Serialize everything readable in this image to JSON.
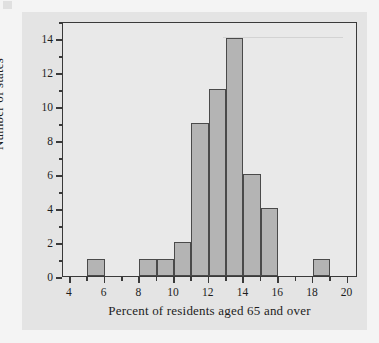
{
  "chart_data": {
    "type": "bar",
    "title": "",
    "subtitle": "",
    "xlabel": "Percent of residents aged 65 and over",
    "ylabel": "Number of states",
    "xlim": [
      3.6,
      20.6
    ],
    "ylim": [
      0,
      15
    ],
    "grid": false,
    "legend": null,
    "bin_width": 1,
    "categories": [
      "5-6",
      "8-9",
      "9-10",
      "10-11",
      "11-12",
      "12-13",
      "13-14",
      "14-15",
      "15-16",
      "18-19"
    ],
    "bins": [
      {
        "start": 5,
        "end": 6,
        "value": 1
      },
      {
        "start": 8,
        "end": 9,
        "value": 1
      },
      {
        "start": 9,
        "end": 10,
        "value": 1
      },
      {
        "start": 10,
        "end": 11,
        "value": 2
      },
      {
        "start": 11,
        "end": 12,
        "value": 9
      },
      {
        "start": 12,
        "end": 13,
        "value": 11
      },
      {
        "start": 13,
        "end": 14,
        "value": 14
      },
      {
        "start": 14,
        "end": 15,
        "value": 6
      },
      {
        "start": 15,
        "end": 16,
        "value": 4
      },
      {
        "start": 18,
        "end": 19,
        "value": 1
      }
    ],
    "values": [
      1,
      1,
      1,
      2,
      9,
      11,
      14,
      6,
      4,
      1
    ],
    "xticks": [
      4,
      6,
      8,
      10,
      12,
      14,
      16,
      18,
      20
    ],
    "xticks_minor": [
      5,
      7,
      9,
      11,
      13,
      15,
      17,
      19
    ],
    "yticks": [
      0,
      2,
      4,
      6,
      8,
      10,
      12,
      14
    ],
    "yticks_minor": [
      1,
      3,
      5,
      7,
      9,
      11,
      13,
      15
    ],
    "xtick_labels": [
      "4",
      "6",
      "8",
      "10",
      "12",
      "14",
      "16",
      "18",
      "20"
    ],
    "ytick_labels": [
      "0",
      "2",
      "4",
      "6",
      "8",
      "10",
      "12",
      "14"
    ],
    "colors": {
      "bar_fill": "#b4b4b4",
      "bar_border": "#4a4a4a",
      "axis": "#3a3a3a",
      "plot_background": "#e9e9e9",
      "figure_background": "#e4e4e4",
      "page_background": "#f4f4f4",
      "text": "#1d1d1d"
    }
  }
}
